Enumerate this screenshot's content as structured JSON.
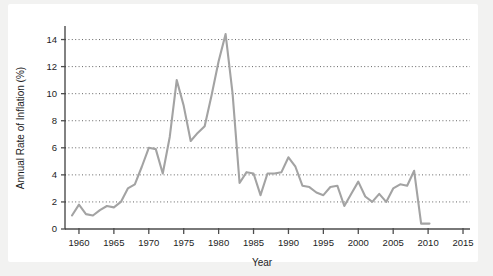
{
  "figure": {
    "background_color": "#f2f2f1",
    "card_color": "#ffffff",
    "axis_color": "#4d4d4d",
    "grid_color": "#555555",
    "text_color": "#1d1d1d"
  },
  "chart_data": {
    "type": "line",
    "title": "",
    "subtitle": "",
    "xlabel": "Year",
    "ylabel": "Annual Rate of Inflation (%)",
    "xlim": [
      1958,
      2016
    ],
    "ylim": [
      0,
      15
    ],
    "xticks": [
      1960,
      1965,
      1970,
      1975,
      1980,
      1985,
      1990,
      1995,
      2000,
      2005,
      2010,
      2015
    ],
    "xtick_labels": [
      "1960",
      "1965",
      "1970",
      "1975",
      "1980",
      "1985",
      "1990",
      "1995",
      "2000",
      "2005",
      "2010",
      "2015"
    ],
    "yticks": [
      0,
      2,
      4,
      6,
      8,
      10,
      12,
      14
    ],
    "ytick_labels": [
      "0",
      "2",
      "4",
      "6",
      "8",
      "10",
      "12",
      "14"
    ],
    "grid": "horizontal-dotted",
    "legend": "none",
    "line_color": "#a3a3a3",
    "line_width": 2.1,
    "series": [
      {
        "name": "Annual Rate of Inflation",
        "x": [
          1959,
          1960,
          1961,
          1962,
          1963,
          1964,
          1965,
          1966,
          1967,
          1968,
          1969,
          1970,
          1971,
          1972,
          1973,
          1974,
          1975,
          1976,
          1977,
          1978,
          1979,
          1980,
          1981,
          1982,
          1983,
          1984,
          1985,
          1986,
          1987,
          1988,
          1989,
          1990,
          1991,
          1992,
          1993,
          1994,
          1995,
          1996,
          1997,
          1998,
          1999,
          2000,
          2001,
          2002,
          2003,
          2004,
          2005,
          2006,
          2007,
          2008,
          2009
        ],
        "values": [
          1.0,
          1.8,
          1.1,
          1.0,
          1.4,
          1.7,
          1.6,
          2.0,
          3.0,
          3.3,
          4.6,
          6.0,
          5.9,
          4.1,
          6.8,
          11.0,
          9.1,
          6.5,
          7.1,
          7.6,
          9.9,
          12.4,
          14.4,
          10.0,
          3.4,
          4.2,
          4.1,
          2.5,
          4.1,
          4.1,
          4.2,
          5.3,
          4.6,
          3.2,
          3.1,
          2.7,
          2.5,
          3.1,
          3.2,
          1.7,
          2.6,
          3.5,
          2.4,
          2.0,
          2.6,
          2.0,
          3.0,
          3.3,
          3.2,
          4.3,
          0.4
        ],
        "end_segment_note": "flat tail near 0.4 after 2009"
      }
    ],
    "peaks": [
      {
        "x": 1974,
        "y": 11.0,
        "label": "1974 peak"
      },
      {
        "x": 1981,
        "y": 14.4,
        "label": "1981-82 peak"
      },
      {
        "x": 1990,
        "y": 5.3,
        "label": "1990 local peak"
      },
      {
        "x": 2008,
        "y": 4.3,
        "label": "2008 local peak"
      }
    ],
    "minimums": [
      {
        "x": 1962,
        "y": 1.0,
        "label": "early-1960s low"
      },
      {
        "x": 2009,
        "y": 0.4,
        "label": "2009 low"
      }
    ]
  }
}
